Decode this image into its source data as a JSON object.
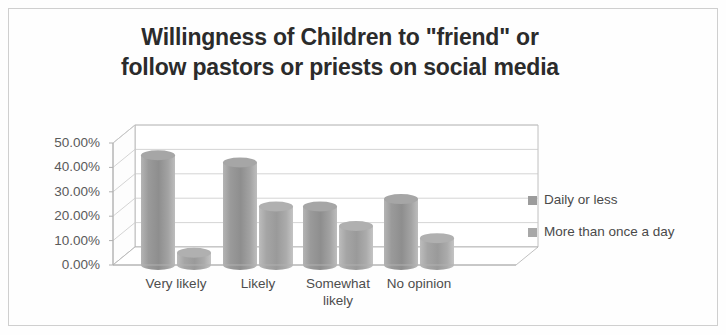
{
  "chart_data": {
    "type": "bar",
    "title": "Willingness of Children to \"friend\" or follow pastors or priests on social media",
    "title_lines": [
      "Willingness of Children to \"friend\" or",
      "follow pastors or priests on social media"
    ],
    "xlabel": "",
    "ylabel": "",
    "categories": [
      "Very likely",
      "Likely",
      "Somewhat likely",
      "No opinion"
    ],
    "category_lines": [
      [
        "Very likely"
      ],
      [
        "Likely"
      ],
      [
        "Somewhat",
        "likely"
      ],
      [
        "No opinion"
      ]
    ],
    "series": [
      {
        "name": "Daily or less",
        "values": [
          45.0,
          42.0,
          24.0,
          27.0
        ],
        "color": "#9c9c9c"
      },
      {
        "name": "More than once a day",
        "values": [
          5.0,
          24.0,
          16.0,
          11.0
        ],
        "color": "#a8a8a8"
      }
    ],
    "ylim": [
      0,
      50
    ],
    "yticks": [
      50,
      40,
      30,
      20,
      10,
      0
    ],
    "ytick_labels": [
      "50.00%",
      "40.00%",
      "30.00%",
      "20.00%",
      "10.00%",
      "0.00%"
    ],
    "grid": true,
    "grid_axis": "y",
    "legend_position": "right",
    "style": "3d-cylinder",
    "axis_color": "#b0b0b0",
    "grid_color": "#c9c9c9",
    "text_color": "#4d4d4d",
    "title_color": "#2b2b2b",
    "background": "#ffffff"
  },
  "legend": {
    "entries": [
      {
        "label": "Daily or less",
        "swatch": "#9c9c9c"
      },
      {
        "label": "More than once a day",
        "swatch": "#a8a8a8"
      }
    ]
  }
}
